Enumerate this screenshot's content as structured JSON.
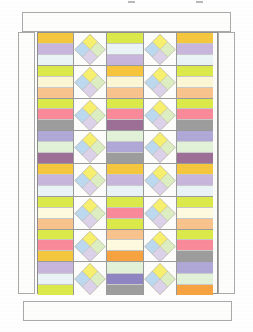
{
  "document": {
    "kind": "quilt-pattern-diagram",
    "title": "",
    "background_color": "#ffffff",
    "outline_color": "#9a9a9a"
  },
  "page_marks": {
    "tick_positions": [
      128,
      196
    ]
  },
  "border": {
    "label": "plain outer border",
    "fill": "#fdfdfc",
    "stroke": "#a9a9a9",
    "pieces": [
      "top",
      "bottom",
      "left",
      "right"
    ]
  },
  "palette": {
    "gold": "#f5c73f",
    "golden_yellow": "#f7c53c",
    "orange": "#f7a341",
    "peach": "#f9c38d",
    "lime": "#dbe94a",
    "lime_light": "#e4ef6a",
    "cream": "#fbf7d4",
    "pale_cream": "#fdfae0",
    "ice_blue": "#eaf4f7",
    "pale_mint": "#e2f2d8",
    "mint": "#ddeccd",
    "lavender": "#c9b6dd",
    "lavender_mid": "#b0a8d6",
    "violet": "#8f85c3",
    "plum": "#a06ba0",
    "mauve": "#9d6f97",
    "pink": "#f98a9a",
    "rose": "#f98b98",
    "gray": "#9d9d9d",
    "blue_patch": "#bcd9ef",
    "yellow_patch": "#f7ef6e",
    "green_patch": "#ddeec3",
    "lilac_patch": "#dcd2ea",
    "white": "#fdfdfb"
  },
  "grid": {
    "columns": 5,
    "rows": 8,
    "column_kinds": [
      "strip",
      "diamond",
      "strip",
      "diamond",
      "strip"
    ]
  },
  "diamond_block": {
    "label": "four-patch on-point block",
    "ground": "#fdfdfb",
    "patches": {
      "top": "#f7ef6e",
      "left": "#bcd9ef",
      "right": "#ddeec3",
      "bottom": "#dcd2ea"
    },
    "stroke": "#b0a89a"
  },
  "strip_blocks": {
    "col1": [
      [
        "#f5c73f",
        "#c9b6dd",
        "#eaf4f7"
      ],
      [
        "#dbe94a",
        "#fbf7d4",
        "#f9c38d"
      ],
      [
        "#dbe94a",
        "#f98a9a",
        "#9d9d9d"
      ],
      [
        "#b0a8d6",
        "#e2f2d8",
        "#9d6f97"
      ],
      [
        "#f5c73f",
        "#c9b6dd",
        "#eaf4f7"
      ],
      [
        "#dbe94a",
        "#fdfae0",
        "#f9c38d"
      ],
      [
        "#dbe94a",
        "#f98a9a",
        "#f5c73f"
      ],
      [
        "#c9b6dd",
        "#eaf4f7",
        "#dbe94a"
      ]
    ],
    "col3": [
      [
        "#dbe94a",
        "#eaf4f7",
        "#c9b6dd"
      ],
      [
        "#f7c53c",
        "#fbf7d4",
        "#f9c38d"
      ],
      [
        "#dbe94a",
        "#f98a9a",
        "#9d6f97"
      ],
      [
        "#e2f2d8",
        "#b0a8d6",
        "#9d9d9d"
      ],
      [
        "#f5c73f",
        "#c9b6dd",
        "#eaf4f7"
      ],
      [
        "#dbe94a",
        "#f98a9a",
        "#dbe94a"
      ],
      [
        "#f9c38d",
        "#fdfae0",
        "#f7a341"
      ],
      [
        "#e2f2d8",
        "#8f85c3",
        "#9d9d9d"
      ]
    ],
    "col5": [
      [
        "#f5c73f",
        "#c9b6dd",
        "#eaf4f7"
      ],
      [
        "#dbe94a",
        "#fbf7d4",
        "#f9c38d"
      ],
      [
        "#dbe94a",
        "#f98a9a",
        "#9d9d9d"
      ],
      [
        "#b0a8d6",
        "#e2f2d8",
        "#9d6f97"
      ],
      [
        "#f5c73f",
        "#c9b6dd",
        "#eaf4f7"
      ],
      [
        "#dbe94a",
        "#fdfae0",
        "#f9c38d"
      ],
      [
        "#dbe94a",
        "#f98a9a",
        "#9d9d9d"
      ],
      [
        "#b0a8d6",
        "#e2f2d8",
        "#f7a341"
      ]
    ]
  }
}
